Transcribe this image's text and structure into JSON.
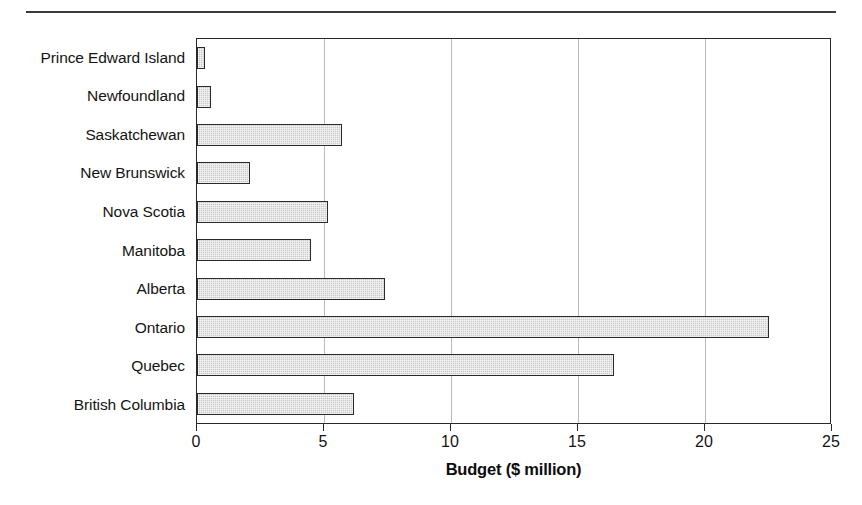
{
  "figure": {
    "top_rule": "",
    "background_color": "#ffffff",
    "frame_color": "#2a2a2a",
    "bar_fill_color": "#c9c9c9",
    "bar_edge_color": "#2b2b2b",
    "gridline_color": "#b9b9b9"
  },
  "chart_data": {
    "type": "bar",
    "orientation": "horizontal",
    "title": "",
    "xlabel": "Budget ($ million)",
    "ylabel": "",
    "categories": [
      "Prince Edward Island",
      "Newfoundland",
      "Saskatchewan",
      "New Brunswick",
      "Nova Scotia",
      "Manitoba",
      "Alberta",
      "Ontario",
      "Quebec",
      "British Columbia"
    ],
    "values": [
      0.3,
      0.55,
      5.7,
      2.1,
      5.15,
      4.5,
      7.4,
      22.5,
      16.4,
      6.2
    ],
    "xlim": [
      0,
      25
    ],
    "xticks": [
      0,
      5,
      10,
      15,
      20,
      25
    ],
    "xtick_labels": [
      "0",
      "5",
      "10",
      "15",
      "20",
      "25"
    ],
    "grid": "vertical-only",
    "legend": "none"
  }
}
